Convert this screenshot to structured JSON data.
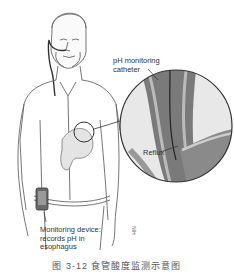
{
  "figure": {
    "labels": {
      "catheter": [
        "pH monitoring",
        "catheter"
      ],
      "reflux": "Reflux",
      "device": [
        "Monitoring device:",
        "records pH in",
        "esophagus"
      ]
    },
    "signature": "NIH",
    "caption": "图 3-12  食管酸度监测示意图"
  },
  "colors": {
    "line": "#555555",
    "tissue_dark": "#6e6e6e",
    "tissue_mid": "#a8a8a8",
    "tissue_light": "#d6d6d6",
    "background": "#ffffff"
  }
}
